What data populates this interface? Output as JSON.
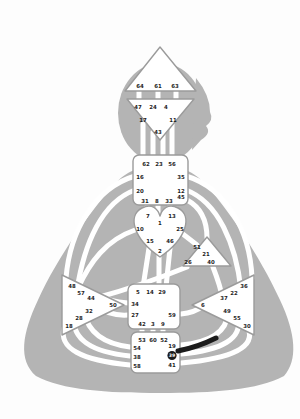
{
  "diagram": {
    "kind": "human-design-bodygraph",
    "colors": {
      "body_silhouette": "#b4b4b4",
      "center_fill": "#ffffff",
      "center_border": "#9b9b9b",
      "gate_text": "#1f1f1f",
      "highlight": "#1b1b1b"
    },
    "highlight": {
      "gate": "39",
      "channel_segment": "39-55"
    }
  },
  "centers": {
    "head": {
      "name": "Head",
      "shape": "triangle-up",
      "gates": [
        "64",
        "61",
        "63"
      ]
    },
    "ajna": {
      "name": "Ajna",
      "shape": "triangle-down",
      "gates": [
        "47",
        "24",
        "4",
        "17",
        "11",
        "43"
      ]
    },
    "throat": {
      "name": "Throat",
      "shape": "square",
      "gates": [
        "62",
        "23",
        "56",
        "16",
        "35",
        "20",
        "12",
        "31",
        "8",
        "33",
        "45"
      ]
    },
    "g": {
      "name": "G",
      "shape": "heart",
      "gates": [
        "7",
        "13",
        "1",
        "10",
        "25",
        "15",
        "46",
        "2"
      ]
    },
    "ego": {
      "name": "Ego",
      "shape": "triangle",
      "gates": [
        "51",
        "21",
        "26",
        "40"
      ]
    },
    "spleen": {
      "name": "Spleen",
      "shape": "triangle-left",
      "gates": [
        "48",
        "57",
        "44",
        "50",
        "32",
        "28",
        "18"
      ]
    },
    "solar_plexus": {
      "name": "Solar Plexus",
      "shape": "triangle-right",
      "gates": [
        "36",
        "22",
        "37",
        "6",
        "49",
        "55",
        "30"
      ]
    },
    "sacral": {
      "name": "Sacral",
      "shape": "square",
      "gates": [
        "5",
        "14",
        "29",
        "34",
        "27",
        "59",
        "42",
        "3",
        "9"
      ]
    },
    "root": {
      "name": "Root",
      "shape": "square",
      "gates": [
        "53",
        "60",
        "52",
        "54",
        "38",
        "58",
        "19",
        "39",
        "41"
      ]
    }
  }
}
